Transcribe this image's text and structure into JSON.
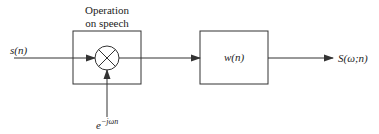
{
  "diagram": {
    "title_line1": "Operation",
    "title_line2": "on speech",
    "input_label": "s(n)",
    "window_label": "w(n)",
    "output_label": "S(ω;n)",
    "modulator_base": "e",
    "modulator_exponent": "−jωn",
    "multiplier_symbol": "multiply-cross"
  },
  "colors": {
    "stroke": "#333333",
    "text": "#222222",
    "background": "#ffffff"
  }
}
